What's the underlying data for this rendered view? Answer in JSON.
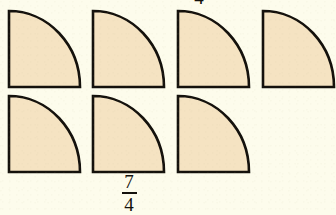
{
  "figure": {
    "kind": "fraction-model-quarter-circles",
    "background_color": "#fdfcec",
    "shape_fill_color": "#f5e3c2",
    "shape_stroke_color": "#14110c",
    "shape_stroke_width": 2,
    "shape_width": 72,
    "shape_height": 78,
    "rows": [
      {
        "name": "top-row",
        "y": 10,
        "shapes": [
          {
            "name": "quarter-circle-1",
            "x": 8
          },
          {
            "name": "quarter-circle-2",
            "x": 92
          },
          {
            "name": "quarter-circle-3",
            "x": 177
          },
          {
            "name": "quarter-circle-4",
            "x": 262
          }
        ]
      },
      {
        "name": "bottom-row",
        "y": 95,
        "shapes": [
          {
            "name": "quarter-circle-5",
            "x": 8
          },
          {
            "name": "quarter-circle-6",
            "x": 92
          },
          {
            "name": "quarter-circle-7",
            "x": 177
          }
        ]
      }
    ]
  },
  "labels": {
    "bottom_fraction": {
      "numerator": "7",
      "denominator": "4"
    },
    "top_fraction": {
      "numerator": "",
      "denominator": "4"
    }
  }
}
